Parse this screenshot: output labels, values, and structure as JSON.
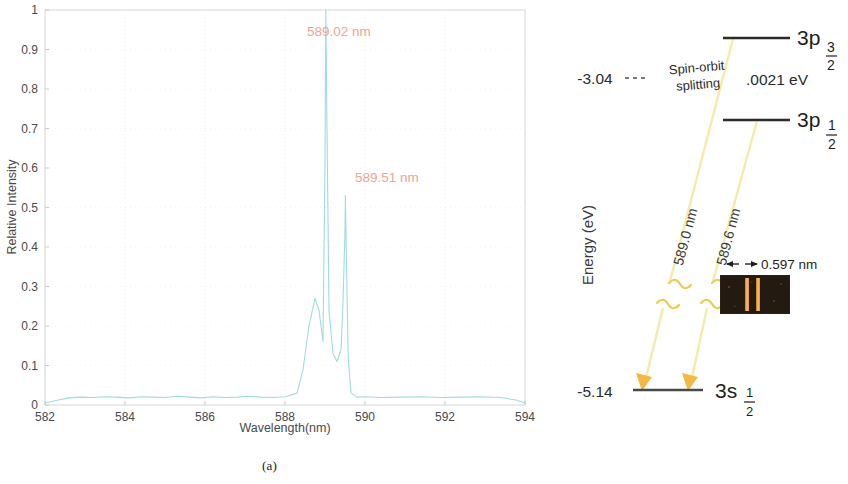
{
  "figure": {
    "caption_a": "(a)",
    "caption_b": "(b)"
  },
  "chart_data": {
    "type": "line",
    "title": "",
    "xlabel": "Wavelength(nm)",
    "ylabel": "Relative Intensity",
    "xlim": [
      582,
      594
    ],
    "ylim": [
      0,
      1
    ],
    "xticks": [
      "582",
      "584",
      "586",
      "588",
      "590",
      "592",
      "594"
    ],
    "yticks": [
      "0",
      "0.1",
      "0.2",
      "0.3",
      "0.4",
      "0.5",
      "0.6",
      "0.7",
      "0.8",
      "0.9",
      "1"
    ],
    "grid": true,
    "legend": "none",
    "series": [
      {
        "name": "Sodium emission spectrum",
        "color": "#9fdbe0",
        "x": [
          582.0,
          582.3,
          582.6,
          582.9,
          583.2,
          583.5,
          583.8,
          584.1,
          584.4,
          584.7,
          585.0,
          585.3,
          585.6,
          585.9,
          586.2,
          586.5,
          586.8,
          587.1,
          587.4,
          587.7,
          588.0,
          588.3,
          588.45,
          588.6,
          588.75,
          588.85,
          588.95,
          589.0,
          589.02,
          589.05,
          589.1,
          589.2,
          589.3,
          589.4,
          589.45,
          589.5,
          589.51,
          589.53,
          589.58,
          589.65,
          589.8,
          590.0,
          590.4,
          590.9,
          591.4,
          591.9,
          592.4,
          592.9,
          593.4,
          593.8,
          594.0
        ],
        "y": [
          0.005,
          0.012,
          0.018,
          0.02,
          0.019,
          0.021,
          0.02,
          0.018,
          0.021,
          0.02,
          0.019,
          0.022,
          0.02,
          0.018,
          0.021,
          0.019,
          0.02,
          0.022,
          0.02,
          0.019,
          0.021,
          0.03,
          0.09,
          0.2,
          0.27,
          0.24,
          0.16,
          0.62,
          1.0,
          0.7,
          0.24,
          0.13,
          0.11,
          0.14,
          0.26,
          0.44,
          0.53,
          0.4,
          0.12,
          0.03,
          0.02,
          0.021,
          0.019,
          0.02,
          0.021,
          0.019,
          0.02,
          0.021,
          0.019,
          0.012,
          0.005
        ]
      }
    ],
    "annotations": [
      {
        "id": "peak-1",
        "text": "589.02 nm",
        "x": 588.55,
        "y": 0.935,
        "color": "#f0a58e"
      },
      {
        "id": "peak-2",
        "text": "589.51 nm",
        "x": 589.75,
        "y": 0.565,
        "color": "#f0a58e"
      }
    ]
  },
  "energy_diagram": {
    "axis_label": "Energy (eV)",
    "levels": [
      {
        "id": "3p32",
        "label_main": "3p",
        "label_sub": "3",
        "label_den": "2",
        "energy": ""
      },
      {
        "id": "3p12",
        "label_main": "3p",
        "label_sub": "1",
        "label_den": "2",
        "energy": ""
      },
      {
        "id": "3s12",
        "label_main": "3s",
        "label_sub": "1",
        "label_den": "2",
        "energy": "-5.14"
      }
    ],
    "excited_energy": "-3.04",
    "splitting_label_line1": "Spin-orbit",
    "splitting_label_line2": "splitting",
    "splitting_value": ".0021 eV",
    "transitions": [
      {
        "id": "t1",
        "label": "589.0 nm",
        "color": "#f7efb0"
      },
      {
        "id": "t2",
        "label": "589.6 nm",
        "color": "#f7efb0"
      }
    ],
    "spectrum_image": {
      "separation_label": "0.597 nm",
      "line_color": "#f0a64a",
      "background_color": "#231a12"
    }
  }
}
